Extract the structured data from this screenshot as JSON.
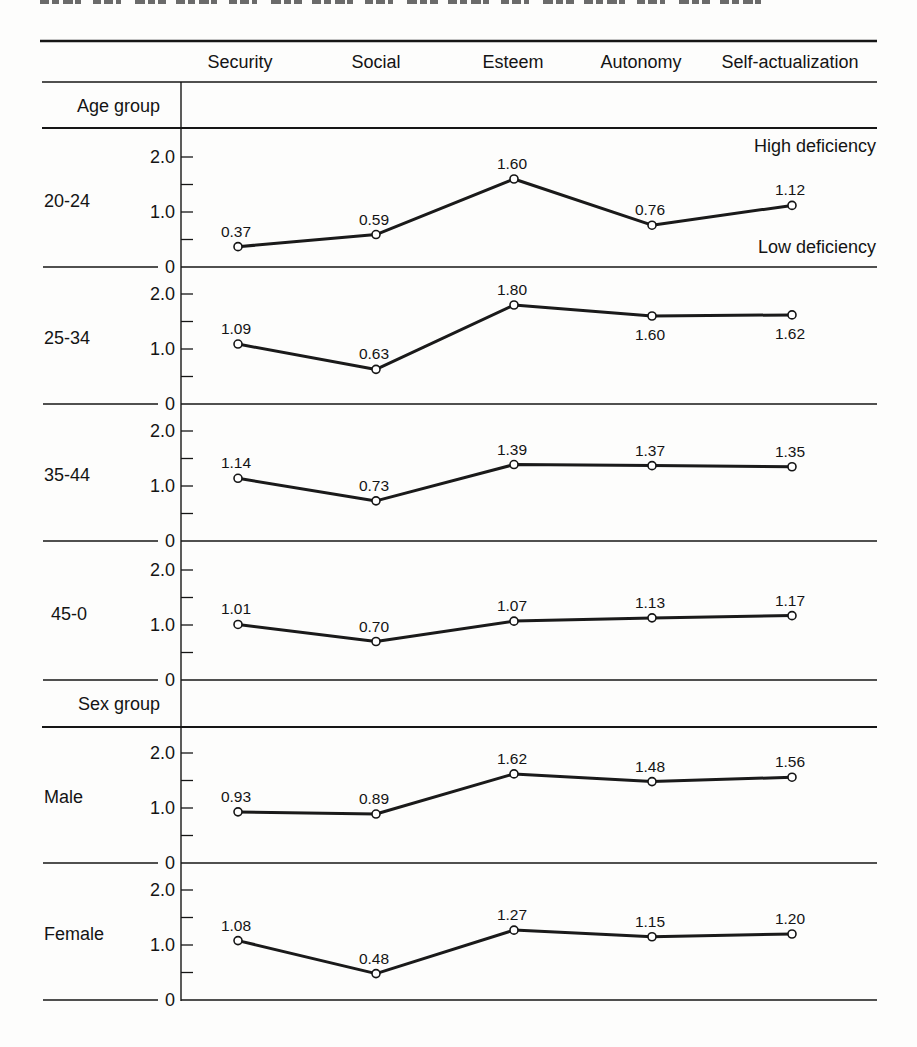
{
  "chart_data": {
    "type": "line",
    "title": "",
    "xlabel": "",
    "ylabel": "",
    "categories": [
      "Security",
      "Social",
      "Esteem",
      "Autonomy",
      "Self-actualization"
    ],
    "ylim": [
      0,
      2.0
    ],
    "yticks": [
      0,
      1.0,
      2.0
    ],
    "ytick_labels": [
      "0",
      "1.0",
      "2.0"
    ],
    "minor_yticks": [
      0.5,
      1.5
    ],
    "grid": false,
    "legend": null,
    "layout": "small multiples, one panel per group row, shared x categories in header",
    "annotations": {
      "top": "High deficiency",
      "bottom": "Low deficiency"
    },
    "groups": [
      {
        "name": "Age group",
        "series": [
          "20-24",
          "25-34",
          "35-44",
          "45-0"
        ]
      },
      {
        "name": "Sex group",
        "series": [
          "Male",
          "Female"
        ]
      }
    ],
    "series": [
      {
        "name": "20-24",
        "group": "Age group",
        "values": [
          0.37,
          0.59,
          1.6,
          0.76,
          1.12
        ],
        "labels": [
          "0.37",
          "0.59",
          "1.60",
          "0.76",
          "1.12"
        ],
        "label_position": [
          "above",
          "above",
          "above",
          "above",
          "above"
        ]
      },
      {
        "name": "25-34",
        "group": "Age group",
        "values": [
          1.09,
          0.63,
          1.8,
          1.6,
          1.62
        ],
        "labels": [
          "1.09",
          "0.63",
          "1.80",
          "1.60",
          "1.62"
        ],
        "label_position": [
          "above",
          "above",
          "above",
          "below",
          "below"
        ]
      },
      {
        "name": "35-44",
        "group": "Age group",
        "values": [
          1.14,
          0.73,
          1.39,
          1.37,
          1.35
        ],
        "labels": [
          "1.14",
          "0.73",
          "1.39",
          "1.37",
          "1.35"
        ],
        "label_position": [
          "above",
          "above",
          "above",
          "above",
          "above"
        ]
      },
      {
        "name": "45-0",
        "group": "Age group",
        "values": [
          1.01,
          0.7,
          1.07,
          1.13,
          1.17
        ],
        "labels": [
          "1.01",
          "0.70",
          "1.07",
          "1.13",
          "1.17"
        ],
        "label_position": [
          "above",
          "above",
          "above",
          "above",
          "above"
        ]
      },
      {
        "name": "Male",
        "group": "Sex group",
        "values": [
          0.93,
          0.89,
          1.62,
          1.48,
          1.56
        ],
        "labels": [
          "0.93",
          "0.89",
          "1.62",
          "1.48",
          "1.56"
        ],
        "label_position": [
          "above",
          "above",
          "above",
          "above",
          "above"
        ]
      },
      {
        "name": "Female",
        "group": "Sex group",
        "values": [
          1.08,
          0.48,
          1.27,
          1.15,
          1.2
        ],
        "labels": [
          "1.08",
          "0.48",
          "1.27",
          "1.15",
          "1.20"
        ],
        "label_position": [
          "above",
          "above",
          "above",
          "above",
          "above"
        ]
      }
    ]
  }
}
